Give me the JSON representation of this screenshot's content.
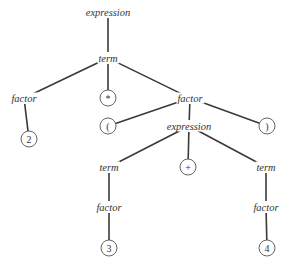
{
  "diagram": {
    "type": "parse-tree",
    "expression_parsed": "2 * (3 + 4)",
    "nodes": [
      {
        "id": "n0",
        "label": "expression",
        "kind": "nonterminal",
        "x": 108,
        "y": 12
      },
      {
        "id": "n1",
        "label": "term",
        "kind": "nonterminal",
        "x": 108,
        "y": 58
      },
      {
        "id": "n2",
        "label": "factor",
        "kind": "nonterminal",
        "x": 24,
        "y": 98
      },
      {
        "id": "n3",
        "label": "*",
        "kind": "terminal",
        "x": 108,
        "y": 98
      },
      {
        "id": "n4",
        "label": "factor",
        "kind": "nonterminal",
        "x": 190,
        "y": 98
      },
      {
        "id": "n5",
        "label": "2",
        "kind": "terminal",
        "x": 29,
        "y": 139
      },
      {
        "id": "n6",
        "label": "(",
        "kind": "terminal",
        "x": 108,
        "y": 126
      },
      {
        "id": "n7",
        "label": "expression",
        "kind": "nonterminal",
        "x": 189,
        "y": 126
      },
      {
        "id": "n8",
        "label": ")",
        "kind": "terminal",
        "x": 267,
        "y": 126
      },
      {
        "id": "n9",
        "label": "term",
        "kind": "nonterminal",
        "x": 109,
        "y": 167
      },
      {
        "id": "n10",
        "label": "+",
        "kind": "terminal",
        "x": 188,
        "y": 167
      },
      {
        "id": "n11",
        "label": "term",
        "kind": "nonterminal",
        "x": 266,
        "y": 167
      },
      {
        "id": "n12",
        "label": "factor",
        "kind": "nonterminal",
        "x": 109,
        "y": 207
      },
      {
        "id": "n13",
        "label": "factor",
        "kind": "nonterminal",
        "x": 266,
        "y": 207
      },
      {
        "id": "n14",
        "label": "3",
        "kind": "terminal",
        "x": 109,
        "y": 248
      },
      {
        "id": "n15",
        "label": "4",
        "kind": "terminal",
        "x": 267,
        "y": 248
      }
    ],
    "edges": [
      [
        "n0",
        "n1"
      ],
      [
        "n1",
        "n2"
      ],
      [
        "n1",
        "n3"
      ],
      [
        "n1",
        "n4"
      ],
      [
        "n2",
        "n5"
      ],
      [
        "n4",
        "n6"
      ],
      [
        "n4",
        "n7"
      ],
      [
        "n4",
        "n8"
      ],
      [
        "n7",
        "n9"
      ],
      [
        "n7",
        "n10"
      ],
      [
        "n7",
        "n11"
      ],
      [
        "n9",
        "n12"
      ],
      [
        "n11",
        "n13"
      ],
      [
        "n12",
        "n14"
      ],
      [
        "n13",
        "n15"
      ]
    ]
  }
}
